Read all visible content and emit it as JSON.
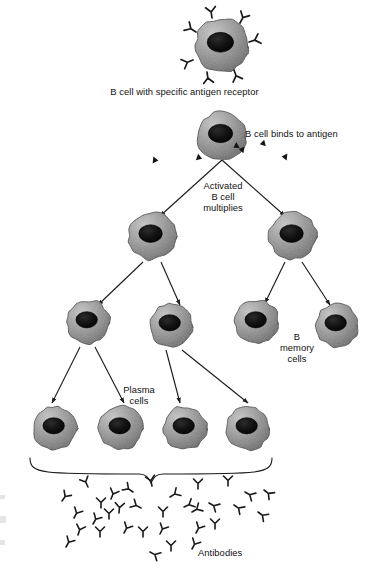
{
  "figure": {
    "type": "biology-flow-diagram",
    "background": "#ffffff"
  },
  "labels": {
    "top_cell": "B cell with specific antigen receptor",
    "binds": "B cell binds to antigen",
    "activated_line1": "Activated",
    "activated_line2": "B cell",
    "activated_line3": "multiplies",
    "memory_line1": "B",
    "memory_line2": "memory",
    "memory_line3": "cells",
    "plasma_line1": "Plasma",
    "plasma_line2": "cells",
    "antibodies": "Antibodies"
  },
  "colors": {
    "cell_light": "#b9b9b9",
    "cell_mid": "#8f8f8f",
    "cell_dark": "#6b6b6b",
    "cell_outline": "#4a4a4a",
    "nucleus": "#1a1a1a",
    "nucleus_edge": "#000000",
    "ink": "#111111",
    "arrow": "#1d1d1d"
  },
  "cells": [
    {
      "id": "b-cell-receptor",
      "name": "b-cell-with-receptors",
      "cx": 222,
      "cy": 45,
      "r": 27,
      "receptors": true
    },
    {
      "id": "b-cell-bound",
      "name": "b-cell-binding-antigen",
      "cx": 222,
      "cy": 136,
      "r": 25,
      "antigens": true
    },
    {
      "id": "activated-left",
      "name": "activated-b-cell-left",
      "cx": 152,
      "cy": 236,
      "r": 24
    },
    {
      "id": "activated-right",
      "name": "activated-b-cell-right",
      "cx": 293,
      "cy": 236,
      "r": 24
    },
    {
      "id": "gen3-1",
      "name": "daughter-cell-1",
      "cx": 88,
      "cy": 322,
      "r": 22
    },
    {
      "id": "gen3-2",
      "name": "daughter-cell-2",
      "cx": 171,
      "cy": 325,
      "r": 22
    },
    {
      "id": "gen3-3",
      "name": "memory-cell-1",
      "cx": 257,
      "cy": 322,
      "r": 22
    },
    {
      "id": "gen3-4",
      "name": "memory-cell-2",
      "cx": 337,
      "cy": 325,
      "r": 22
    },
    {
      "id": "plasma-1",
      "name": "plasma-cell-1",
      "cx": 55,
      "cy": 428,
      "r": 22
    },
    {
      "id": "plasma-2",
      "name": "plasma-cell-2",
      "cx": 121,
      "cy": 428,
      "r": 22
    },
    {
      "id": "plasma-3",
      "name": "plasma-cell-3",
      "cx": 185,
      "cy": 428,
      "r": 22
    },
    {
      "id": "plasma-4",
      "name": "plasma-cell-4",
      "cx": 248,
      "cy": 428,
      "r": 22
    }
  ],
  "receptors": [
    {
      "x": 212,
      "y": 18,
      "rot": -8
    },
    {
      "x": 240,
      "y": 23,
      "rot": 28
    },
    {
      "x": 249,
      "y": 42,
      "rot": 72
    },
    {
      "x": 196,
      "y": 32,
      "rot": -58
    },
    {
      "x": 193,
      "y": 60,
      "rot": -112
    },
    {
      "x": 207,
      "y": 72,
      "rot": 172
    },
    {
      "x": 234,
      "y": 70,
      "rot": 160
    }
  ],
  "antigens": [
    {
      "x": 244,
      "y": 150,
      "rot": 10
    },
    {
      "x": 265,
      "y": 143,
      "rot": -14
    },
    {
      "x": 287,
      "y": 157,
      "rot": 6
    },
    {
      "x": 197,
      "y": 157,
      "rot": 200
    },
    {
      "x": 153,
      "y": 160,
      "rot": 186
    },
    {
      "x": 238,
      "y": 145,
      "rot": -30
    }
  ],
  "arrows": [
    {
      "name": "arrow-split-left",
      "x1": 222,
      "y1": 160,
      "x2": 160,
      "y2": 216
    },
    {
      "name": "arrow-split-right",
      "x1": 222,
      "y1": 160,
      "x2": 285,
      "y2": 216
    },
    {
      "name": "arrow-gen3-1",
      "x1": 143,
      "y1": 262,
      "x2": 98,
      "y2": 305
    },
    {
      "name": "arrow-gen3-2",
      "x1": 161,
      "y1": 262,
      "x2": 180,
      "y2": 305
    },
    {
      "name": "arrow-gen3-3",
      "x1": 285,
      "y1": 262,
      "x2": 265,
      "y2": 303
    },
    {
      "name": "arrow-gen3-4",
      "x1": 302,
      "y1": 262,
      "x2": 330,
      "y2": 305
    },
    {
      "name": "arrow-plasma-1",
      "x1": 80,
      "y1": 347,
      "x2": 52,
      "y2": 403
    },
    {
      "name": "arrow-plasma-2",
      "x1": 95,
      "y1": 347,
      "x2": 124,
      "y2": 403
    },
    {
      "name": "arrow-plasma-3",
      "x1": 166,
      "y1": 350,
      "x2": 180,
      "y2": 403
    },
    {
      "name": "arrow-plasma-4",
      "x1": 182,
      "y1": 350,
      "x2": 248,
      "y2": 403
    }
  ],
  "brace": {
    "name": "plasma-cells-brace",
    "left": 30,
    "right": 272,
    "top": 458,
    "bottom": 474,
    "mid": 151
  },
  "antibodies": [
    {
      "x": 62,
      "y": 501,
      "rot": 35
    },
    {
      "x": 88,
      "y": 487,
      "rot": -25
    },
    {
      "x": 111,
      "y": 499,
      "rot": 22
    },
    {
      "x": 133,
      "y": 492,
      "rot": -55
    },
    {
      "x": 152,
      "y": 486,
      "rot": -12
    },
    {
      "x": 170,
      "y": 497,
      "rot": 58
    },
    {
      "x": 198,
      "y": 489,
      "rot": 0
    },
    {
      "x": 228,
      "y": 486,
      "rot": 0
    },
    {
      "x": 245,
      "y": 492,
      "rot": 120
    },
    {
      "x": 264,
      "y": 490,
      "rot": 128
    },
    {
      "x": 119,
      "y": 513,
      "rot": 5
    },
    {
      "x": 141,
      "y": 508,
      "rot": -62
    },
    {
      "x": 101,
      "y": 508,
      "rot": 0
    },
    {
      "x": 184,
      "y": 507,
      "rot": 65
    },
    {
      "x": 209,
      "y": 503,
      "rot": 120
    },
    {
      "x": 234,
      "y": 505,
      "rot": 124
    },
    {
      "x": 258,
      "y": 512,
      "rot": 126
    },
    {
      "x": 74,
      "y": 518,
      "rot": 28
    },
    {
      "x": 93,
      "y": 524,
      "rot": 30
    },
    {
      "x": 109,
      "y": 519,
      "rot": 0
    },
    {
      "x": 163,
      "y": 517,
      "rot": 0
    },
    {
      "x": 192,
      "y": 512,
      "rot": 60
    },
    {
      "x": 78,
      "y": 535,
      "rot": 18
    },
    {
      "x": 100,
      "y": 537,
      "rot": 0
    },
    {
      "x": 124,
      "y": 533,
      "rot": 28
    },
    {
      "x": 143,
      "y": 537,
      "rot": 0
    },
    {
      "x": 160,
      "y": 534,
      "rot": 26
    },
    {
      "x": 196,
      "y": 533,
      "rot": 28
    },
    {
      "x": 215,
      "y": 529,
      "rot": 0
    },
    {
      "x": 66,
      "y": 547,
      "rot": 30
    },
    {
      "x": 150,
      "y": 552,
      "rot": 118
    },
    {
      "x": 171,
      "y": 551,
      "rot": 0
    },
    {
      "x": 192,
      "y": 549,
      "rot": 28
    }
  ],
  "edge_artifacts": [
    {
      "x": 0,
      "y": 495,
      "w": 5,
      "h": 4
    },
    {
      "x": 0,
      "y": 516,
      "w": 6,
      "h": 7
    },
    {
      "x": 0,
      "y": 540,
      "w": 5,
      "h": 5
    }
  ]
}
